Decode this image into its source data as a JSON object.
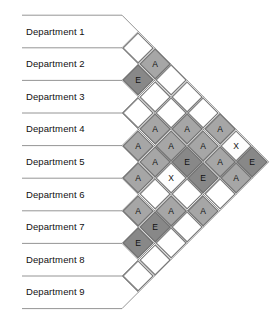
{
  "chart_data": {
    "type": "table",
    "title": "",
    "chart_kind": "activity-relationship-chart",
    "departments": [
      "Department 1",
      "Department 2",
      "Department 3",
      "Department 4",
      "Department 5",
      "Department 6",
      "Department 7",
      "Department 8",
      "Department 9"
    ],
    "rating_legend": {
      "A": "A",
      "E": "E",
      "X": "X",
      "blank": ""
    },
    "colors": {
      "A": "#a6a6a6",
      "E": "#888888",
      "X": "#fdfdfd",
      "blank": "#ffffff",
      "cell_border": "#6f6f6f",
      "row_line": "#7a7a7a",
      "text": "#111111",
      "background": "#ffffff"
    },
    "relationships": [
      {
        "from": 1,
        "to": 2,
        "value": ""
      },
      {
        "from": 1,
        "to": 3,
        "value": "A"
      },
      {
        "from": 1,
        "to": 4,
        "value": ""
      },
      {
        "from": 1,
        "to": 5,
        "value": ""
      },
      {
        "from": 1,
        "to": 6,
        "value": ""
      },
      {
        "from": 1,
        "to": 7,
        "value": "A"
      },
      {
        "from": 1,
        "to": 8,
        "value": "X"
      },
      {
        "from": 1,
        "to": 9,
        "value": "E"
      },
      {
        "from": 2,
        "to": 3,
        "value": "E"
      },
      {
        "from": 2,
        "to": 4,
        "value": ""
      },
      {
        "from": 2,
        "to": 5,
        "value": ""
      },
      {
        "from": 2,
        "to": 6,
        "value": "A"
      },
      {
        "from": 2,
        "to": 7,
        "value": "A"
      },
      {
        "from": 2,
        "to": 8,
        "value": "A"
      },
      {
        "from": 2,
        "to": 9,
        "value": "A"
      },
      {
        "from": 3,
        "to": 4,
        "value": ""
      },
      {
        "from": 3,
        "to": 5,
        "value": "A"
      },
      {
        "from": 3,
        "to": 6,
        "value": "A"
      },
      {
        "from": 3,
        "to": 7,
        "value": "E"
      },
      {
        "from": 3,
        "to": 8,
        "value": "E"
      },
      {
        "from": 3,
        "to": 9,
        "value": ""
      },
      {
        "from": 4,
        "to": 5,
        "value": "A"
      },
      {
        "from": 4,
        "to": 6,
        "value": "A"
      },
      {
        "from": 4,
        "to": 7,
        "value": "X"
      },
      {
        "from": 4,
        "to": 8,
        "value": ""
      },
      {
        "from": 4,
        "to": 9,
        "value": "A"
      },
      {
        "from": 5,
        "to": 6,
        "value": "A"
      },
      {
        "from": 5,
        "to": 7,
        "value": ""
      },
      {
        "from": 5,
        "to": 8,
        "value": "A"
      },
      {
        "from": 5,
        "to": 9,
        "value": ""
      },
      {
        "from": 6,
        "to": 7,
        "value": "A"
      },
      {
        "from": 6,
        "to": 8,
        "value": "E"
      },
      {
        "from": 6,
        "to": 9,
        "value": ""
      },
      {
        "from": 7,
        "to": 8,
        "value": "E"
      },
      {
        "from": 7,
        "to": 9,
        "value": ""
      },
      {
        "from": 8,
        "to": 9,
        "value": ""
      }
    ]
  }
}
